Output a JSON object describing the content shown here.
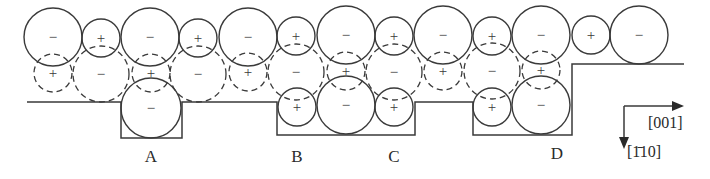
{
  "figure": {
    "sites": [
      {
        "id": "A",
        "label": "A",
        "x": 151,
        "y": 160
      },
      {
        "id": "B",
        "label": "B",
        "x": 297,
        "y": 160
      },
      {
        "id": "C",
        "label": "C",
        "x": 394,
        "y": 160
      },
      {
        "id": "D",
        "label": "D",
        "x": 557,
        "y": 158
      }
    ],
    "axes": {
      "horizontal_label": "[001]",
      "vertical_label": "[1̄10]"
    },
    "signs": {
      "anion": "−",
      "cation": "+"
    },
    "top_row": [
      {
        "x": 53,
        "y": 37,
        "r": 29,
        "sign": "−"
      },
      {
        "x": 101,
        "y": 38,
        "r": 19,
        "sign": "+"
      },
      {
        "x": 150,
        "y": 37,
        "r": 29,
        "sign": "−"
      },
      {
        "x": 198,
        "y": 38,
        "r": 19,
        "sign": "+"
      },
      {
        "x": 248,
        "y": 37,
        "r": 29,
        "sign": "−"
      },
      {
        "x": 296,
        "y": 36,
        "r": 19,
        "sign": "+"
      },
      {
        "x": 346,
        "y": 35,
        "r": 29,
        "sign": "−"
      },
      {
        "x": 394,
        "y": 36,
        "r": 19,
        "sign": "+"
      },
      {
        "x": 443,
        "y": 35,
        "r": 29,
        "sign": "−"
      },
      {
        "x": 492,
        "y": 36,
        "r": 19,
        "sign": "+"
      },
      {
        "x": 541,
        "y": 35,
        "r": 29,
        "sign": "−"
      },
      {
        "x": 591,
        "y": 35,
        "r": 19,
        "sign": "+"
      },
      {
        "x": 639,
        "y": 35,
        "r": 29,
        "sign": "−"
      }
    ],
    "middle_row": [
      {
        "x": 53,
        "y": 73,
        "r": 19,
        "sign": "+"
      },
      {
        "x": 101,
        "y": 74,
        "r": 28,
        "sign": "−"
      },
      {
        "x": 151,
        "y": 73,
        "r": 19,
        "sign": "+"
      },
      {
        "x": 198,
        "y": 74,
        "r": 28,
        "sign": "−"
      },
      {
        "x": 248,
        "y": 72,
        "r": 19,
        "sign": "+"
      },
      {
        "x": 296,
        "y": 72,
        "r": 28,
        "sign": "−"
      },
      {
        "x": 346,
        "y": 71,
        "r": 19,
        "sign": "+"
      },
      {
        "x": 394,
        "y": 72,
        "r": 28,
        "sign": "−"
      },
      {
        "x": 443,
        "y": 71,
        "r": 19,
        "sign": "+"
      },
      {
        "x": 492,
        "y": 71,
        "r": 28,
        "sign": "−"
      },
      {
        "x": 541,
        "y": 70,
        "r": 19,
        "sign": "+"
      }
    ],
    "bottom_row": [
      {
        "x": 151,
        "y": 108,
        "r": 30,
        "sign": "−"
      },
      {
        "x": 297,
        "y": 107,
        "r": 19,
        "sign": "+"
      },
      {
        "x": 346,
        "y": 105,
        "r": 29,
        "sign": "−"
      },
      {
        "x": 394,
        "y": 107,
        "r": 19,
        "sign": "+"
      },
      {
        "x": 492,
        "y": 107,
        "r": 19,
        "sign": "+"
      },
      {
        "x": 541,
        "y": 105,
        "r": 29,
        "sign": "−"
      }
    ]
  }
}
